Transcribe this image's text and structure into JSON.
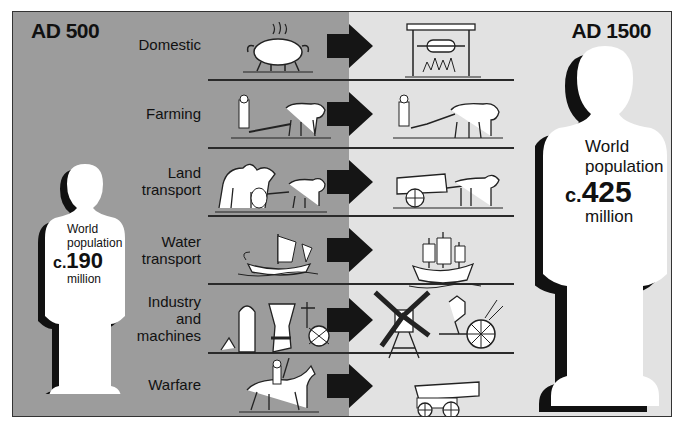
{
  "colors": {
    "left_panel": "#9c9c9c",
    "right_panel": "#e2e2e2",
    "ink": "#111111",
    "figure_fill": "#ffffff",
    "figure_shadow": "#111111"
  },
  "left": {
    "era": "AD 500",
    "population": {
      "line1": "World",
      "line2": "population",
      "prefix": "c.",
      "value": "190",
      "unit": "million"
    }
  },
  "right": {
    "era": "AD 1500",
    "population": {
      "line1": "World",
      "line2": "population",
      "prefix": "c.",
      "value": "425",
      "unit": "million"
    }
  },
  "categories": [
    {
      "label_lines": [
        "Domestic"
      ],
      "before": "cauldron-over-fire",
      "after": "hearth-with-spit"
    },
    {
      "label_lines": [
        "Farming"
      ],
      "before": "man-with-ox-plough",
      "after": "man-with-two-oxen-plough"
    },
    {
      "label_lines": [
        "Land",
        "transport"
      ],
      "before": "camel-and-ox-cart",
      "after": "horse-drawn-wagon"
    },
    {
      "label_lines": [
        "Water",
        "transport"
      ],
      "before": "small-sailing-ship",
      "after": "three-masted-carrack"
    },
    {
      "label_lines": [
        "Industry",
        "and",
        "machines"
      ],
      "before": "furnace-and-waterwheel",
      "after": "windmill-and-waterwheel"
    },
    {
      "label_lines": [
        "Warfare"
      ],
      "before": "mounted-horseman",
      "after": "cannon-on-carriage"
    }
  ]
}
